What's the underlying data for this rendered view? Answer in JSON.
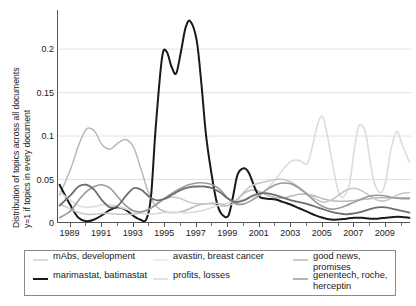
{
  "chart_data": {
    "type": "line",
    "title": "",
    "xlabel": "",
    "ylabel_line1": "Distribution of topics across all documents",
    "ylabel_line2": "y=1 if topics in every document",
    "xlim": [
      1988.2,
      2010.6
    ],
    "ylim": [
      0,
      0.245
    ],
    "xticks": [
      1989,
      1991,
      1993,
      1995,
      1997,
      1999,
      2001,
      2003,
      2005,
      2007,
      2009
    ],
    "xtick_labels": [
      "1989",
      "1991",
      "1993",
      "1995",
      "1997",
      "1999",
      "2001",
      "2003",
      "2005",
      "2007",
      "2009"
    ],
    "xminor_ticks": [
      1990,
      1992,
      1994,
      1996,
      1998,
      2000,
      2002,
      2004,
      2006,
      2008,
      2010
    ],
    "yticks": [
      0,
      0.05,
      0.1,
      0.15,
      0.2
    ],
    "ytick_labels": [
      "0",
      "0.05",
      "0.1",
      "0.15",
      "0.2"
    ],
    "grid": "horizontal",
    "legend_position": "below",
    "series": [
      {
        "name": "mAbs, development",
        "color": "#b9b9b9",
        "width": 1.5,
        "x": [
          1988.3,
          1989,
          1989.5,
          1990,
          1990.5,
          1991,
          1991.5,
          1992,
          1992.5,
          1993,
          1993.5,
          1994,
          1994.5,
          1995,
          1995.5,
          1996,
          1996.5,
          1997,
          1997.5,
          1998,
          1998.5,
          1999,
          1999.5,
          2000,
          2000.5,
          2001,
          2001.5,
          2002,
          2002.5,
          2003,
          2003.5,
          2004,
          2004.5,
          2005,
          2005.5,
          2006,
          2006.5,
          2007,
          2007.5,
          2008,
          2008.5,
          2009,
          2009.5,
          2010,
          2010.5
        ],
        "y": [
          0.032,
          0.062,
          0.089,
          0.108,
          0.106,
          0.09,
          0.085,
          0.092,
          0.096,
          0.087,
          0.06,
          0.032,
          0.018,
          0.013,
          0.012,
          0.013,
          0.016,
          0.02,
          0.022,
          0.022,
          0.02,
          0.02,
          0.026,
          0.034,
          0.038,
          0.036,
          0.032,
          0.029,
          0.029,
          0.031,
          0.033,
          0.033,
          0.031,
          0.028,
          0.026,
          0.025,
          0.025,
          0.026,
          0.027,
          0.028,
          0.029,
          0.029,
          0.029,
          0.029,
          0.029
        ]
      },
      {
        "name": "marimastat, batimastat",
        "color": "#1a1a1a",
        "width": 2.0,
        "x": [
          1988.3,
          1989,
          1989.5,
          1990,
          1990.5,
          1991,
          1991.5,
          1992,
          1992.5,
          1993,
          1993.4,
          1993.8,
          1994.1,
          1994.4,
          1994.8,
          1995.1,
          1995.4,
          1995.7,
          1996,
          1996.3,
          1996.6,
          1997,
          1997.3,
          1997.6,
          1998,
          1998.3,
          1998.6,
          1999,
          1999.3,
          1999.6,
          2000,
          2000.3,
          2000.7,
          2001,
          2001.5,
          2002,
          2002.5,
          2003,
          2003.5,
          2004,
          2004.5,
          2005,
          2005.5,
          2006,
          2006.5,
          2007,
          2007.5,
          2008,
          2008.5,
          2009,
          2009.5,
          2010,
          2010.5
        ],
        "y": [
          0.044,
          0.02,
          0.006,
          0.002,
          0.004,
          0.009,
          0.015,
          0.018,
          0.015,
          0.008,
          0.004,
          0.004,
          0.03,
          0.11,
          0.19,
          0.197,
          0.18,
          0.172,
          0.197,
          0.225,
          0.232,
          0.21,
          0.16,
          0.1,
          0.05,
          0.022,
          0.01,
          0.008,
          0.03,
          0.056,
          0.063,
          0.058,
          0.04,
          0.03,
          0.028,
          0.027,
          0.024,
          0.021,
          0.017,
          0.013,
          0.009,
          0.006,
          0.004,
          0.004,
          0.005,
          0.006,
          0.006,
          0.005,
          0.005,
          0.006,
          0.007,
          0.007,
          0.006
        ]
      },
      {
        "name": "avastin, breast cancer",
        "color": "#dcdcdc",
        "width": 1.6,
        "x": [
          1988.3,
          1989,
          1989.5,
          1990,
          1990.5,
          1991,
          1991.5,
          1992,
          1992.5,
          1993,
          1993.5,
          1994,
          1994.5,
          1995,
          1995.5,
          1996,
          1996.5,
          1997,
          1997.5,
          1998,
          1998.5,
          1999,
          1999.5,
          2000,
          2000.5,
          2001,
          2001.5,
          2002,
          2002.5,
          2003,
          2003.5,
          2004,
          2004.3,
          2004.7,
          2005,
          2005.3,
          2005.7,
          2006,
          2006.3,
          2006.7,
          2007,
          2007.3,
          2007.7,
          2008,
          2008.3,
          2008.7,
          2009,
          2009.3,
          2009.7,
          2010,
          2010.5
        ],
        "y": [
          0.036,
          0.026,
          0.02,
          0.018,
          0.019,
          0.021,
          0.021,
          0.019,
          0.016,
          0.013,
          0.011,
          0.01,
          0.011,
          0.012,
          0.012,
          0.012,
          0.012,
          0.013,
          0.015,
          0.018,
          0.021,
          0.023,
          0.025,
          0.027,
          0.029,
          0.033,
          0.04,
          0.05,
          0.062,
          0.071,
          0.072,
          0.068,
          0.085,
          0.115,
          0.122,
          0.1,
          0.06,
          0.036,
          0.03,
          0.045,
          0.085,
          0.112,
          0.105,
          0.072,
          0.045,
          0.035,
          0.048,
          0.082,
          0.105,
          0.092,
          0.07
        ]
      },
      {
        "name": "profits, losses",
        "color": "#c6c6c6",
        "width": 1.5,
        "x": [
          1988.3,
          1989,
          1989.5,
          1990,
          1990.5,
          1991,
          1991.5,
          1992,
          1992.5,
          1993,
          1993.5,
          1994,
          1994.5,
          1995,
          1995.5,
          1996,
          1996.5,
          1997,
          1997.5,
          1998,
          1998.5,
          1999,
          1999.5,
          2000,
          2000.5,
          2001,
          2001.5,
          2002,
          2002.5,
          2003,
          2003.5,
          2004,
          2004.5,
          2005,
          2005.5,
          2006,
          2006.5,
          2007,
          2007.5,
          2008,
          2008.5,
          2009,
          2009.5,
          2010,
          2010.5
        ],
        "y": [
          0.022,
          0.016,
          0.012,
          0.01,
          0.01,
          0.011,
          0.011,
          0.01,
          0.01,
          0.01,
          0.012,
          0.016,
          0.023,
          0.028,
          0.03,
          0.028,
          0.024,
          0.022,
          0.022,
          0.023,
          0.022,
          0.02,
          0.025,
          0.036,
          0.043,
          0.046,
          0.048,
          0.05,
          0.05,
          0.047,
          0.041,
          0.034,
          0.028,
          0.024,
          0.026,
          0.032,
          0.038,
          0.04,
          0.037,
          0.031,
          0.026,
          0.026,
          0.03,
          0.034,
          0.035
        ]
      },
      {
        "name": "good news, promises",
        "color": "#9a9a9a",
        "width": 1.6,
        "x": [
          1988.3,
          1989,
          1989.5,
          1990,
          1990.5,
          1991,
          1991.5,
          1992,
          1992.5,
          1993,
          1993.5,
          1994,
          1994.5,
          1995,
          1995.5,
          1996,
          1996.5,
          1997,
          1997.5,
          1998,
          1998.5,
          1999,
          1999.5,
          2000,
          2000.5,
          2001,
          2001.5,
          2002,
          2002.5,
          2003,
          2003.5,
          2004,
          2004.5,
          2005,
          2005.5,
          2006,
          2006.5,
          2007,
          2007.5,
          2008,
          2008.5,
          2009,
          2009.5,
          2010,
          2010.5
        ],
        "y": [
          0.006,
          0.014,
          0.026,
          0.036,
          0.042,
          0.044,
          0.04,
          0.03,
          0.02,
          0.014,
          0.013,
          0.016,
          0.022,
          0.029,
          0.035,
          0.04,
          0.044,
          0.046,
          0.046,
          0.044,
          0.038,
          0.028,
          0.022,
          0.022,
          0.026,
          0.032,
          0.039,
          0.044,
          0.046,
          0.045,
          0.04,
          0.033,
          0.025,
          0.019,
          0.016,
          0.017,
          0.02,
          0.024,
          0.028,
          0.031,
          0.032,
          0.031,
          0.029,
          0.028,
          0.028
        ]
      },
      {
        "name": "genentech, roche, herceptin",
        "color": "#6e6e6e",
        "width": 1.8,
        "x": [
          1988.3,
          1989,
          1989.5,
          1990,
          1990.5,
          1991,
          1991.5,
          1992,
          1992.5,
          1993,
          1993.5,
          1994,
          1994.5,
          1995,
          1995.5,
          1996,
          1996.5,
          1997,
          1997.5,
          1998,
          1998.5,
          1999,
          1999.5,
          2000,
          2000.5,
          2001,
          2001.5,
          2002,
          2002.5,
          2003,
          2003.5,
          2004,
          2004.5,
          2005,
          2005.5,
          2006,
          2006.5,
          2007,
          2007.5,
          2008,
          2008.5,
          2009,
          2009.5,
          2010,
          2010.5
        ],
        "y": [
          0.02,
          0.032,
          0.042,
          0.044,
          0.038,
          0.026,
          0.018,
          0.02,
          0.031,
          0.04,
          0.038,
          0.03,
          0.026,
          0.028,
          0.033,
          0.038,
          0.041,
          0.042,
          0.042,
          0.04,
          0.035,
          0.028,
          0.024,
          0.026,
          0.031,
          0.034,
          0.034,
          0.032,
          0.029,
          0.026,
          0.024,
          0.022,
          0.019,
          0.016,
          0.013,
          0.011,
          0.01,
          0.011,
          0.013,
          0.016,
          0.018,
          0.018,
          0.016,
          0.014,
          0.012
        ]
      }
    ]
  },
  "legend": {
    "entries": [
      {
        "label": "mAbs, development",
        "color": "#b9b9b9",
        "width": 1.5
      },
      {
        "label": "marimastat, batimastat",
        "color": "#1a1a1a",
        "width": 2.2
      },
      {
        "label": "avastin, breast cancer",
        "color": "#dcdcdc",
        "width": 1.6
      },
      {
        "label": "profits, losses",
        "color": "#c6c6c6",
        "width": 1.5
      },
      {
        "label": "good news, promises",
        "color": "#9a9a9a",
        "width": 1.6
      },
      {
        "label": "genentech, roche,\nherceptin",
        "color": "#6e6e6e",
        "width": 1.8
      }
    ]
  }
}
